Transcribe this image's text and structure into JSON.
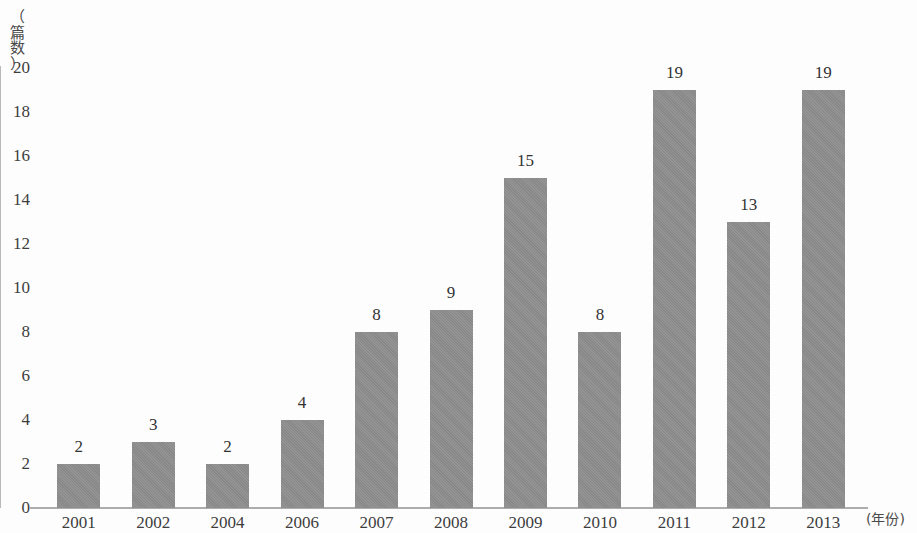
{
  "chart_data": {
    "type": "bar",
    "title": "",
    "subtitle": "",
    "xlabel": "(年份)",
    "ylabel": "（篇数）",
    "categories": [
      "2001",
      "2002",
      "2004",
      "2006",
      "2007",
      "2008",
      "2009",
      "2010",
      "2011",
      "2012",
      "2013"
    ],
    "values": [
      2,
      3,
      2,
      4,
      8,
      9,
      15,
      8,
      19,
      13,
      19
    ],
    "data_labels": [
      "2",
      "3",
      "2",
      "4",
      "8",
      "9",
      "15",
      "8",
      "19",
      "13",
      "19"
    ],
    "ylim": [
      0,
      20
    ],
    "y_ticks": [
      "0",
      "2",
      "4",
      "6",
      "8",
      "10",
      "12",
      "14",
      "16",
      "18",
      "20"
    ],
    "y_tick_values": [
      0,
      2,
      4,
      6,
      8,
      10,
      12,
      14,
      16,
      18,
      20
    ],
    "grid": false,
    "legend": null,
    "legend_position": "none",
    "bar_color": "#8e8e8e",
    "axis_color": "#b0b0b0",
    "text_color": "#333333",
    "background_color": "#fdfdfd"
  }
}
